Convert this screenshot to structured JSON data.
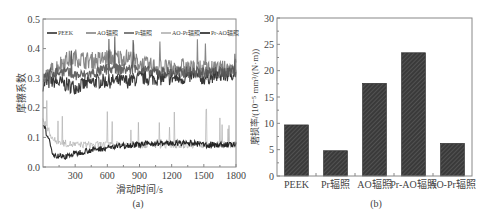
{
  "figure": {
    "panel_a": {
      "caption": "(a)",
      "xlabel": "滑动时间/s",
      "ylabel": "摩擦系数",
      "xticks": [
        "300",
        "600",
        "900",
        "1200",
        "1500",
        "1800"
      ],
      "yticks": [
        "0.0",
        "0.1",
        "0.2",
        "0.3",
        "0.4",
        "0.5"
      ],
      "legend": [
        "PEEK",
        "AO辐照",
        "Pr辐照",
        "AO-Pr辐照",
        "Pr-AO辐照"
      ]
    },
    "panel_b": {
      "caption": "(b)",
      "ylabel": "磨损率/(10⁻⁵ mm³/(N·m))",
      "yticks": [
        "0",
        "5",
        "10",
        "15",
        "20",
        "25",
        "30"
      ],
      "categories": [
        "PEEK",
        "Pr辐照",
        "AO辐照",
        "Pr-AO辐照",
        "AO-Pr辐照"
      ]
    }
  },
  "colors": {
    "frame": "#888888",
    "bar_fill": "#3a3a3a",
    "bar_hatch": "#6a6a6a",
    "series_dark": "#222222",
    "series_mid": "#555555",
    "series_gray": "#7a7a7a",
    "series_light": "#aaaaaa"
  },
  "chart_data": [
    {
      "type": "line",
      "title": "(a)",
      "xlabel": "滑动时间/s",
      "ylabel": "摩擦系数",
      "xlim": [
        0,
        1800
      ],
      "ylim": [
        0.0,
        0.5
      ],
      "xticks": [
        300,
        600,
        900,
        1200,
        1500,
        1800
      ],
      "yticks": [
        0.0,
        0.1,
        0.2,
        0.3,
        0.4,
        0.5
      ],
      "grid": false,
      "legend_position": "top inside",
      "x": [
        0,
        100,
        200,
        300,
        400,
        500,
        600,
        700,
        800,
        900,
        1000,
        1100,
        1200,
        1300,
        1400,
        1500,
        1600,
        1700,
        1800
      ],
      "series": [
        {
          "name": "PEEK",
          "values": [
            0.28,
            0.29,
            0.28,
            0.27,
            0.28,
            0.29,
            0.29,
            0.29,
            0.29,
            0.3,
            0.3,
            0.3,
            0.3,
            0.3,
            0.31,
            0.3,
            0.31,
            0.31,
            0.32
          ]
        },
        {
          "name": "AO辐照",
          "values": [
            0.29,
            0.33,
            0.36,
            0.37,
            0.36,
            0.36,
            0.37,
            0.37,
            0.37,
            0.35,
            0.34,
            0.34,
            0.33,
            0.34,
            0.33,
            0.33,
            0.33,
            0.33,
            0.34
          ]
        },
        {
          "name": "Pr辐照",
          "values": [
            0.3,
            0.32,
            0.32,
            0.31,
            0.31,
            0.32,
            0.33,
            0.33,
            0.33,
            0.33,
            0.32,
            0.32,
            0.32,
            0.32,
            0.32,
            0.32,
            0.32,
            0.32,
            0.33
          ]
        },
        {
          "name": "AO-Pr辐照",
          "values": [
            0.16,
            0.09,
            0.08,
            0.075,
            0.075,
            0.075,
            0.075,
            0.075,
            0.075,
            0.075,
            0.075,
            0.075,
            0.075,
            0.075,
            0.075,
            0.075,
            0.075,
            0.075,
            0.075
          ]
        },
        {
          "name": "Pr-AO辐照",
          "values": [
            0.15,
            0.04,
            0.035,
            0.045,
            0.055,
            0.06,
            0.065,
            0.07,
            0.075,
            0.075,
            0.08,
            0.08,
            0.08,
            0.08,
            0.08,
            0.075,
            0.075,
            0.075,
            0.075
          ]
        }
      ]
    },
    {
      "type": "bar",
      "title": "(b)",
      "xlabel": "",
      "ylabel": "磨损率/(10⁻⁵ mm³/(N·m))",
      "categories": [
        "PEEK",
        "Pr辐照",
        "AO辐照",
        "Pr-AO辐照",
        "AO-Pr辐照"
      ],
      "values": [
        9.7,
        4.8,
        17.6,
        23.4,
        6.2
      ],
      "ylim": [
        0,
        30
      ],
      "yticks": [
        0,
        5,
        10,
        15,
        20,
        25,
        30
      ],
      "grid": false,
      "bar_style": "dark hatched"
    }
  ]
}
